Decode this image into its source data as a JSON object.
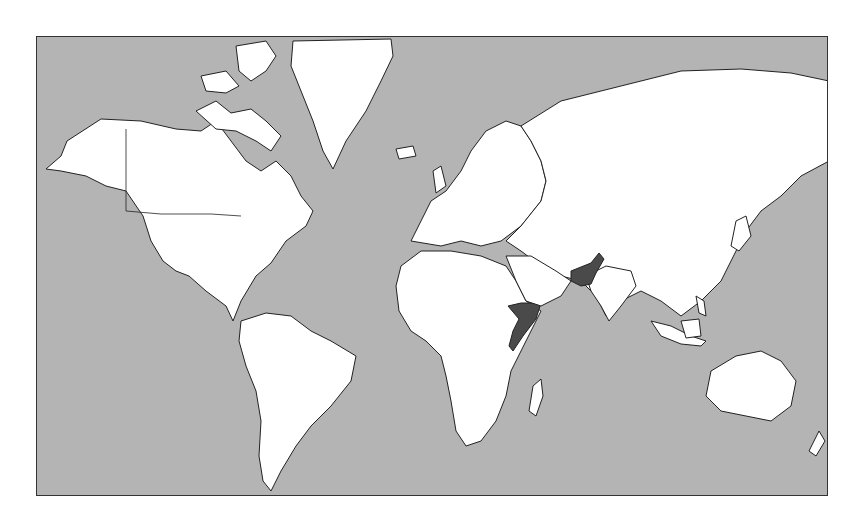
{
  "map": {
    "projection": "mercator",
    "colors": {
      "ocean": "#b4b4b4",
      "land": "#ffffff",
      "highlight": "#4a4a4a",
      "border": "#222222"
    },
    "highlighted_countries": [
      "Pakistan",
      "Somalia"
    ]
  }
}
